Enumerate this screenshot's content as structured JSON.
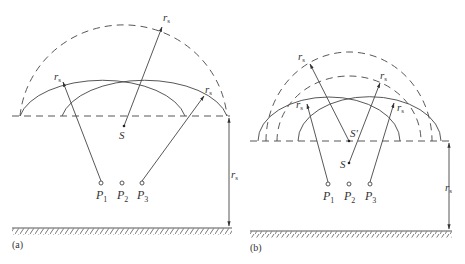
{
  "figure": {
    "panels": [
      {
        "id": "a",
        "label": "(a)",
        "source_label": "S",
        "points": [
          "P",
          "P",
          "P"
        ],
        "point_subscripts": [
          "1",
          "2",
          "3"
        ],
        "radius_label": "r",
        "radius_subscript": "s"
      },
      {
        "id": "b",
        "label": "(b)",
        "source_label": "S",
        "virtual_source_label": "S′",
        "points": [
          "P",
          "P",
          "P"
        ],
        "point_subscripts": [
          "1",
          "2",
          "3"
        ],
        "radius_label": "r",
        "radius_subscript": "s"
      }
    ],
    "colors": {
      "line": "#444444",
      "ground_hatch": "#555555",
      "background": "#ffffff"
    }
  }
}
